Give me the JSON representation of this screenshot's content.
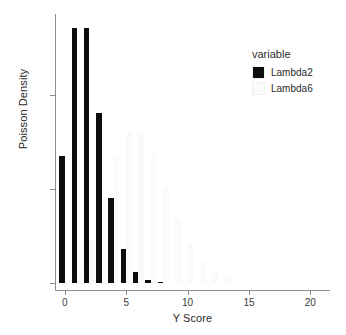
{
  "chart_data": {
    "type": "bar",
    "title": "",
    "subtitle": "",
    "xlabel": "Y Score",
    "ylabel": "Poisson Density",
    "xlim": [
      -0.8,
      21.6
    ],
    "ylim": [
      0.0,
      0.2855
    ],
    "grid": false,
    "legend_position": "right",
    "legend_title": "variable",
    "x_ticks": [
      0,
      5,
      10,
      15,
      20
    ],
    "x_tick_labels": [
      "0",
      "5",
      "10",
      "15",
      "20"
    ],
    "y_ticks": [
      0.0,
      0.1,
      0.2
    ],
    "y_tick_labels": [
      "0.0",
      "0.1",
      "0.2"
    ],
    "x": [
      0,
      1,
      2,
      3,
      4,
      5,
      6,
      7,
      8,
      9,
      10,
      11,
      12,
      13,
      14,
      15,
      16,
      17,
      18,
      19,
      20,
      21
    ],
    "series": [
      {
        "name": "Lambda2",
        "color": "#0d0d0d",
        "values": [
          0.1353,
          0.2707,
          0.2707,
          0.1804,
          0.0902,
          0.0361,
          0.012,
          0.0034,
          0.0009,
          0.0002,
          0.0,
          0.0,
          0.0,
          0.0,
          0.0,
          0.0,
          0.0,
          0.0,
          0.0,
          0.0,
          0.0,
          0.0
        ]
      },
      {
        "name": "Lambda6",
        "color": "#fafafa",
        "values": [
          0.0025,
          0.0149,
          0.0446,
          0.0892,
          0.1339,
          0.1606,
          0.1606,
          0.1377,
          0.1033,
          0.0688,
          0.0413,
          0.0225,
          0.0113,
          0.0052,
          0.0022,
          0.0009,
          0.0003,
          0.0001,
          0.0,
          0.0,
          0.0,
          0.0
        ]
      }
    ]
  },
  "legend": {
    "title": "variable",
    "entries": [
      {
        "label": "Lambda2",
        "color": "#0d0d0d"
      },
      {
        "label": "Lambda6",
        "color": "#fafafa"
      }
    ]
  },
  "axes": {
    "x_title": "Y Score",
    "y_title": "Poisson Density"
  }
}
